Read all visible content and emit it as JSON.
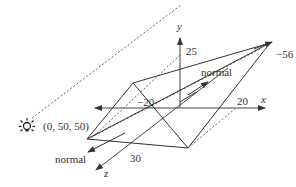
{
  "diagram": {
    "colors": {
      "line": "#333333",
      "axis": "#444444",
      "dashed": "#666666",
      "background": "#ffffff"
    },
    "axes": {
      "x": {
        "label": "x",
        "tick_label": "20",
        "neg_tick_label": "−20"
      },
      "y": {
        "label": "y",
        "tick_label": "25"
      },
      "z": {
        "label": "z",
        "tick_label": "30"
      }
    },
    "vertex_label": "−56",
    "light": {
      "icon": "light-bulb-icon",
      "position_label": "(0, 50, 50)"
    },
    "normals": [
      {
        "label": "normal",
        "location": "upper-center"
      },
      {
        "label": "normal",
        "location": "lower-left"
      }
    ]
  }
}
